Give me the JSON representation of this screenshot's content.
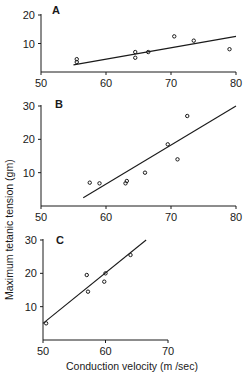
{
  "chart_data": [
    {
      "type": "scatter",
      "panel": "A",
      "xlim": [
        50,
        80
      ],
      "ylim": [
        0,
        20
      ],
      "xticks": [
        50,
        60,
        70,
        80
      ],
      "yticks": [
        10,
        20
      ],
      "points": [
        [
          55.5,
          4.5
        ],
        [
          55.5,
          3.5
        ],
        [
          64.5,
          7
        ],
        [
          64.5,
          5
        ],
        [
          66.5,
          7
        ],
        [
          70.5,
          12.5
        ],
        [
          73.5,
          11
        ],
        [
          79,
          8
        ]
      ],
      "fit_line": [
        [
          55,
          2.5
        ],
        [
          80,
          12.5
        ]
      ]
    },
    {
      "type": "scatter",
      "panel": "B",
      "xlim": [
        50,
        80
      ],
      "ylim": [
        0,
        30
      ],
      "xticks": [
        50,
        60,
        70,
        80
      ],
      "yticks": [
        10,
        20,
        30
      ],
      "points": [
        [
          57.5,
          7
        ],
        [
          59,
          6.8
        ],
        [
          63,
          6.8
        ],
        [
          63.2,
          7.5
        ],
        [
          66,
          10
        ],
        [
          69.5,
          18.5
        ],
        [
          71,
          14
        ],
        [
          72.5,
          27
        ]
      ],
      "fit_line": [
        [
          56.5,
          2.5
        ],
        [
          80,
          30
        ]
      ]
    },
    {
      "type": "scatter",
      "panel": "C",
      "xlim": [
        50,
        70
      ],
      "ylim": [
        0,
        30
      ],
      "xticks": [
        50,
        60,
        70
      ],
      "yticks": [
        10,
        20,
        30
      ],
      "points": [
        [
          50.5,
          5
        ],
        [
          57,
          19.5
        ],
        [
          57.2,
          14.5
        ],
        [
          59.8,
          17.5
        ],
        [
          60,
          20
        ],
        [
          64,
          25.5
        ]
      ],
      "fit_line": [
        [
          50,
          5
        ],
        [
          66.5,
          30
        ]
      ]
    }
  ],
  "labels": {
    "panel_a": "A",
    "panel_b": "B",
    "panel_c": "C",
    "ylabel": "Maximum tetanic tension (gm)",
    "xlabel": "Conduction velocity (m /sec)"
  },
  "colors": {
    "ink": "#1a1a1a",
    "background": "#ffffff"
  }
}
